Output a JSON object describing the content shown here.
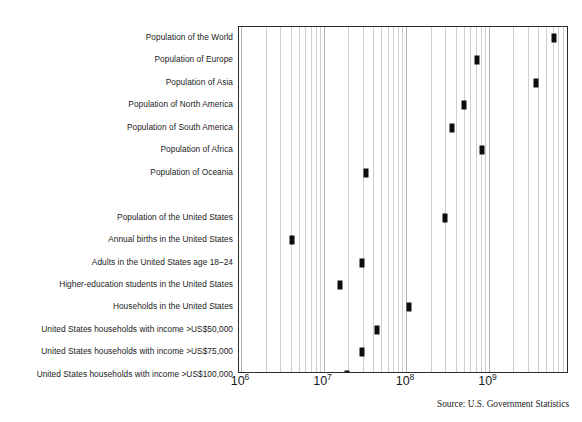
{
  "chart_data": {
    "type": "scatter",
    "title": "",
    "xlabel": "",
    "ylabel": "",
    "xscale": "log",
    "xlim": [
      1000000,
      10000000000
    ],
    "grid": true,
    "legend": false,
    "source_note": "Source: U.S. Government Statistics",
    "xticks": [
      {
        "label_base": "10",
        "label_exp": "6",
        "value": 1000000
      },
      {
        "label_base": "10",
        "label_exp": "7",
        "value": 10000000
      },
      {
        "label_base": "10",
        "label_exp": "8",
        "value": 100000000
      },
      {
        "label_base": "10",
        "label_exp": "9",
        "value": 1000000000
      }
    ],
    "categories": [
      "Population of the World",
      "Population of Europe",
      "Population of Asia",
      "Population of North America",
      "Population of South America",
      "Population of Africa",
      "Population of Oceania",
      "",
      "Population of the United States",
      "Annual births in the United States",
      "Adults in the United States age 18–24",
      "Higher-education students in the United States",
      "Households in the United States",
      "United States households with income >US$50,000",
      "United States households with income >US$75,000",
      "United States households with income >US$100,000"
    ],
    "values": [
      6300000000,
      730000000,
      3800000000,
      500000000,
      360000000,
      840000000,
      33000000,
      null,
      295000000,
      4100000,
      29000000,
      16000000,
      110000000,
      45000000,
      29000000,
      19000000
    ]
  },
  "axis": {
    "marker_color": "#0d0d0d",
    "grid_color": "#cfcfcf",
    "frame_color": "#2b2b2b"
  }
}
